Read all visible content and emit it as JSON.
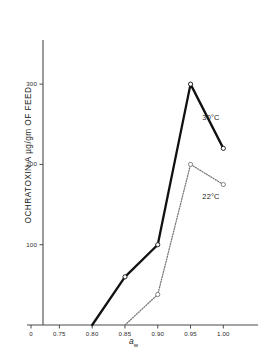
{
  "chart_data": {
    "type": "line",
    "title": "",
    "xlabel": "a_w",
    "ylabel": "OCHRATOXIN A µg/gm OF FEED",
    "xlabel_parts": {
      "symbol": "a",
      "subscript": "w"
    },
    "x_tick_labels": [
      "0",
      "0.75",
      "0.80",
      "0.85",
      "0.90",
      "0.95",
      "1.00"
    ],
    "x_tick_values": [
      0,
      0.75,
      0.8,
      0.85,
      0.9,
      0.95,
      1.0
    ],
    "y_tick_labels": [
      "100",
      "200",
      "300"
    ],
    "y_tick_values": [
      100,
      200,
      300
    ],
    "xlim": [
      0.725,
      1.03
    ],
    "ylim": [
      0,
      345
    ],
    "grid": false,
    "legend_position": "inline-right",
    "marker": "open-circle",
    "series": [
      {
        "name": "30°C",
        "label": "30°C",
        "style": "solid",
        "color": "#111111",
        "x": [
          0.8,
          0.85,
          0.9,
          0.95,
          1.0
        ],
        "values": [
          0,
          60,
          100,
          300,
          220
        ],
        "label_x": 0.968,
        "label_y": 258
      },
      {
        "name": "22°C",
        "label": "22°C",
        "style": "dotted",
        "color": "#777777",
        "x": [
          0.85,
          0.9,
          0.95,
          1.0
        ],
        "values": [
          0,
          38,
          200,
          175
        ],
        "label_x": 0.968,
        "label_y": 160
      }
    ]
  }
}
